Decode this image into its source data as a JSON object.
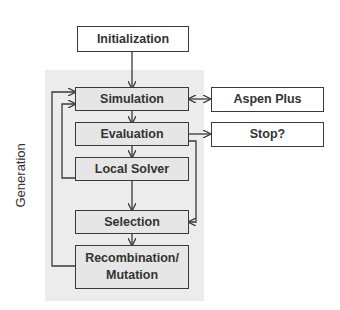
{
  "diagram": {
    "nodes": {
      "initialization": "Initialization",
      "simulation": "Simulation",
      "aspen_plus": "Aspen Plus",
      "evaluation": "Evaluation",
      "stop": "Stop?",
      "local_solver": "Local Solver",
      "selection": "Selection",
      "recombination": "Recombination/ Mutation"
    },
    "region_label": "Generation",
    "edges": [
      {
        "from": "Initialization",
        "to": "Simulation"
      },
      {
        "from": "Simulation",
        "to": "Aspen Plus",
        "bidirectional": true
      },
      {
        "from": "Simulation",
        "to": "Evaluation"
      },
      {
        "from": "Evaluation",
        "to": "Stop?"
      },
      {
        "from": "Evaluation",
        "to": "Local Solver"
      },
      {
        "from": "Evaluation",
        "to": "Selection"
      },
      {
        "from": "Local Solver",
        "to": "Simulation"
      },
      {
        "from": "Local Solver",
        "to": "Selection"
      },
      {
        "from": "Selection",
        "to": "Recombination/ Mutation"
      },
      {
        "from": "Recombination/ Mutation",
        "to": "Simulation"
      }
    ],
    "colors": {
      "region": "#ececec",
      "box_gray": "#e6e6e6",
      "box_white": "#ffffff",
      "stroke": "#3a3a3a"
    }
  }
}
